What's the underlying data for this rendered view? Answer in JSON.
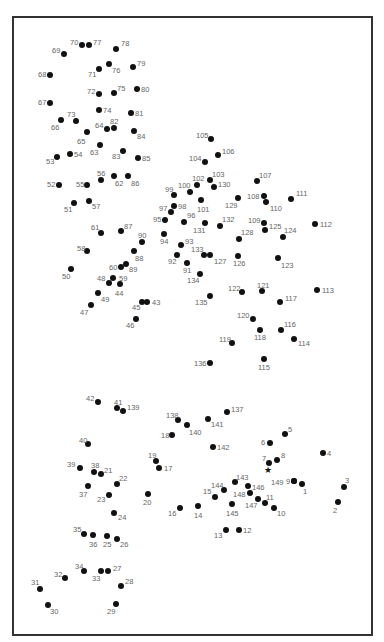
{
  "puzzle": {
    "title": "",
    "start_marker": {
      "symbol": "★",
      "x": 268,
      "y": 471
    },
    "dots": [
      {
        "n": 1,
        "x": 302,
        "y": 484,
        "lx": 303,
        "ly": 488
      },
      {
        "n": 2,
        "x": 338,
        "y": 502,
        "lx": 333,
        "ly": 507
      },
      {
        "n": 3,
        "x": 344,
        "y": 487,
        "lx": 345,
        "ly": 477
      },
      {
        "n": 4,
        "x": 323,
        "y": 453,
        "lx": 327,
        "ly": 450
      },
      {
        "n": 5,
        "x": 285,
        "y": 434,
        "lx": 288,
        "ly": 426
      },
      {
        "n": 6,
        "x": 270,
        "y": 443,
        "lx": 261,
        "ly": 439
      },
      {
        "n": 7,
        "x": 269,
        "y": 463,
        "lx": 262,
        "ly": 455
      },
      {
        "n": 8,
        "x": 277,
        "y": 460,
        "lx": 281,
        "ly": 452
      },
      {
        "n": 9,
        "x": 294,
        "y": 481,
        "lx": 286,
        "ly": 478
      },
      {
        "n": 10,
        "x": 274,
        "y": 508,
        "lx": 277,
        "ly": 510
      },
      {
        "n": 11,
        "x": 265,
        "y": 503,
        "lx": 266,
        "ly": 494
      },
      {
        "n": 12,
        "x": 239,
        "y": 530,
        "lx": 243,
        "ly": 527
      },
      {
        "n": 13,
        "x": 226,
        "y": 530,
        "lx": 214,
        "ly": 532
      },
      {
        "n": 14,
        "x": 198,
        "y": 506,
        "lx": 194,
        "ly": 512
      },
      {
        "n": 15,
        "x": 215,
        "y": 497,
        "lx": 203,
        "ly": 488
      },
      {
        "n": 16,
        "x": 180,
        "y": 508,
        "lx": 168,
        "ly": 510
      },
      {
        "n": 17,
        "x": 159,
        "y": 468,
        "lx": 164,
        "ly": 465
      },
      {
        "n": 18,
        "x": 172,
        "y": 435,
        "lx": 161,
        "ly": 432
      },
      {
        "n": 19,
        "x": 156,
        "y": 461,
        "lx": 148,
        "ly": 452
      },
      {
        "n": 20,
        "x": 148,
        "y": 494,
        "lx": 143,
        "ly": 499
      },
      {
        "n": 21,
        "x": 101,
        "y": 474,
        "lx": 104,
        "ly": 467
      },
      {
        "n": 22,
        "x": 117,
        "y": 484,
        "lx": 119,
        "ly": 475
      },
      {
        "n": 23,
        "x": 109,
        "y": 495,
        "lx": 97,
        "ly": 496
      },
      {
        "n": 24,
        "x": 114,
        "y": 513,
        "lx": 118,
        "ly": 514
      },
      {
        "n": 25,
        "x": 107,
        "y": 536,
        "lx": 103,
        "ly": 541
      },
      {
        "n": 26,
        "x": 117,
        "y": 539,
        "lx": 120,
        "ly": 541
      },
      {
        "n": 27,
        "x": 108,
        "y": 571,
        "lx": 113,
        "ly": 565
      },
      {
        "n": 28,
        "x": 121,
        "y": 586,
        "lx": 125,
        "ly": 578
      },
      {
        "n": 29,
        "x": 116,
        "y": 604,
        "lx": 107,
        "ly": 608
      },
      {
        "n": 30,
        "x": 48,
        "y": 605,
        "lx": 50,
        "ly": 608
      },
      {
        "n": 31,
        "x": 40,
        "y": 589,
        "lx": 31,
        "ly": 579
      },
      {
        "n": 32,
        "x": 65,
        "y": 578,
        "lx": 54,
        "ly": 571
      },
      {
        "n": 33,
        "x": 101,
        "y": 571,
        "lx": 92,
        "ly": 575
      },
      {
        "n": 34,
        "x": 84,
        "y": 571,
        "lx": 75,
        "ly": 563
      },
      {
        "n": 35,
        "x": 84,
        "y": 534,
        "lx": 73,
        "ly": 526
      },
      {
        "n": 36,
        "x": 93,
        "y": 535,
        "lx": 89,
        "ly": 541
      },
      {
        "n": 37,
        "x": 88,
        "y": 486,
        "lx": 79,
        "ly": 491
      },
      {
        "n": 38,
        "x": 94,
        "y": 472,
        "lx": 91,
        "ly": 462
      },
      {
        "n": 39,
        "x": 80,
        "y": 468,
        "lx": 67,
        "ly": 461
      },
      {
        "n": 40,
        "x": 88,
        "y": 444,
        "lx": 79,
        "ly": 437
      },
      {
        "n": 41,
        "x": 117,
        "y": 408,
        "lx": 114,
        "ly": 399
      },
      {
        "n": 42,
        "x": 98,
        "y": 402,
        "lx": 86,
        "ly": 395
      },
      {
        "n": 43,
        "x": 147,
        "y": 302,
        "lx": 152,
        "ly": 299
      },
      {
        "n": 44,
        "x": 120,
        "y": 284,
        "lx": 115,
        "ly": 290
      },
      {
        "n": 45,
        "x": 142,
        "y": 302,
        "lx": 132,
        "ly": 304
      },
      {
        "n": 46,
        "x": 136,
        "y": 319,
        "lx": 126,
        "ly": 322
      },
      {
        "n": 47,
        "x": 91,
        "y": 305,
        "lx": 80,
        "ly": 309
      },
      {
        "n": 48,
        "x": 109,
        "y": 283,
        "lx": 97,
        "ly": 275
      },
      {
        "n": 49,
        "x": 98,
        "y": 293,
        "lx": 101,
        "ly": 296
      },
      {
        "n": 50,
        "x": 71,
        "y": 269,
        "lx": 62,
        "ly": 273
      },
      {
        "n": 51,
        "x": 74,
        "y": 203,
        "lx": 64,
        "ly": 206
      },
      {
        "n": 52,
        "x": 59,
        "y": 185,
        "lx": 47,
        "ly": 181
      },
      {
        "n": 53,
        "x": 57,
        "y": 157,
        "lx": 46,
        "ly": 158
      },
      {
        "n": 54,
        "x": 70,
        "y": 154,
        "lx": 74,
        "ly": 151
      },
      {
        "n": 55,
        "x": 87,
        "y": 185,
        "lx": 76,
        "ly": 181
      },
      {
        "n": 56,
        "x": 101,
        "y": 180,
        "lx": 97,
        "ly": 170
      },
      {
        "n": 57,
        "x": 89,
        "y": 201,
        "lx": 92,
        "ly": 203
      },
      {
        "n": 58,
        "x": 87,
        "y": 251,
        "lx": 77,
        "ly": 245
      },
      {
        "n": 59,
        "x": 113,
        "y": 278,
        "lx": 119,
        "ly": 275
      },
      {
        "n": 60,
        "x": 121,
        "y": 267,
        "lx": 109,
        "ly": 264
      },
      {
        "n": 61,
        "x": 101,
        "y": 233,
        "lx": 91,
        "ly": 224
      },
      {
        "n": 62,
        "x": 114,
        "y": 176,
        "lx": 115,
        "ly": 180
      },
      {
        "n": 63,
        "x": 100,
        "y": 145,
        "lx": 90,
        "ly": 149
      },
      {
        "n": 64,
        "x": 107,
        "y": 129,
        "lx": 95,
        "ly": 122
      },
      {
        "n": 65,
        "x": 87,
        "y": 132,
        "lx": 77,
        "ly": 138
      },
      {
        "n": 66,
        "x": 61,
        "y": 120,
        "lx": 51,
        "ly": 124
      },
      {
        "n": 67,
        "x": 50,
        "y": 103,
        "lx": 38,
        "ly": 99
      },
      {
        "n": 68,
        "x": 50,
        "y": 75,
        "lx": 38,
        "ly": 71
      },
      {
        "n": 69,
        "x": 64,
        "y": 54,
        "lx": 52,
        "ly": 47
      },
      {
        "n": 70,
        "x": 82,
        "y": 45,
        "lx": 70,
        "ly": 39
      },
      {
        "n": 71,
        "x": 99,
        "y": 69,
        "lx": 88,
        "ly": 71
      },
      {
        "n": 72,
        "x": 99,
        "y": 94,
        "lx": 87,
        "ly": 88
      },
      {
        "n": 73,
        "x": 76,
        "y": 121,
        "lx": 67,
        "ly": 111
      },
      {
        "n": 74,
        "x": 99,
        "y": 110,
        "lx": 103,
        "ly": 107
      },
      {
        "n": 75,
        "x": 114,
        "y": 93,
        "lx": 117,
        "ly": 85
      },
      {
        "n": 76,
        "x": 109,
        "y": 64,
        "lx": 112,
        "ly": 67
      },
      {
        "n": 77,
        "x": 89,
        "y": 45,
        "lx": 93,
        "ly": 39
      },
      {
        "n": 78,
        "x": 116,
        "y": 49,
        "lx": 121,
        "ly": 40
      },
      {
        "n": 79,
        "x": 133,
        "y": 67,
        "lx": 137,
        "ly": 60
      },
      {
        "n": 80,
        "x": 137,
        "y": 89,
        "lx": 141,
        "ly": 86
      },
      {
        "n": 81,
        "x": 131,
        "y": 113,
        "lx": 135,
        "ly": 110
      },
      {
        "n": 82,
        "x": 114,
        "y": 128,
        "lx": 110,
        "ly": 118
      },
      {
        "n": 83,
        "x": 123,
        "y": 151,
        "lx": 112,
        "ly": 153
      },
      {
        "n": 84,
        "x": 134,
        "y": 131,
        "lx": 137,
        "ly": 133
      },
      {
        "n": 85,
        "x": 138,
        "y": 158,
        "lx": 142,
        "ly": 155
      },
      {
        "n": 86,
        "x": 128,
        "y": 176,
        "lx": 131,
        "ly": 180
      },
      {
        "n": 87,
        "x": 121,
        "y": 231,
        "lx": 124,
        "ly": 223
      },
      {
        "n": 88,
        "x": 134,
        "y": 251,
        "lx": 135,
        "ly": 255
      },
      {
        "n": 89,
        "x": 126,
        "y": 264,
        "lx": 129,
        "ly": 266
      },
      {
        "n": 90,
        "x": 142,
        "y": 242,
        "lx": 138,
        "ly": 232
      },
      {
        "n": 91,
        "x": 187,
        "y": 263,
        "lx": 183,
        "ly": 267
      },
      {
        "n": 92,
        "x": 177,
        "y": 255,
        "lx": 168,
        "ly": 258
      },
      {
        "n": 93,
        "x": 181,
        "y": 245,
        "lx": 185,
        "ly": 238
      },
      {
        "n": 94,
        "x": 164,
        "y": 234,
        "lx": 160,
        "ly": 238
      },
      {
        "n": 95,
        "x": 165,
        "y": 220,
        "lx": 153,
        "ly": 216
      },
      {
        "n": 96,
        "x": 184,
        "y": 222,
        "lx": 187,
        "ly": 212
      },
      {
        "n": 97,
        "x": 171,
        "y": 212,
        "lx": 159,
        "ly": 205
      },
      {
        "n": 98,
        "x": 174,
        "y": 206,
        "lx": 178,
        "ly": 203
      },
      {
        "n": 99,
        "x": 174,
        "y": 195,
        "lx": 165,
        "ly": 186
      },
      {
        "n": 100,
        "x": 190,
        "y": 192,
        "lx": 178,
        "ly": 182
      },
      {
        "n": 101,
        "x": 201,
        "y": 200,
        "lx": 197,
        "ly": 206
      },
      {
        "n": 102,
        "x": 197,
        "y": 185,
        "lx": 192,
        "ly": 175
      },
      {
        "n": 103,
        "x": 210,
        "y": 180,
        "lx": 212,
        "ly": 171
      },
      {
        "n": 104,
        "x": 205,
        "y": 162,
        "lx": 189,
        "ly": 155
      },
      {
        "n": 105,
        "x": 211,
        "y": 139,
        "lx": 196,
        "ly": 132
      },
      {
        "n": 106,
        "x": 218,
        "y": 155,
        "lx": 222,
        "ly": 148
      },
      {
        "n": 107,
        "x": 257,
        "y": 181,
        "lx": 259,
        "ly": 172
      },
      {
        "n": 108,
        "x": 264,
        "y": 196,
        "lx": 247,
        "ly": 193
      },
      {
        "n": 109,
        "x": 264,
        "y": 223,
        "lx": 248,
        "ly": 217
      },
      {
        "n": 110,
        "x": 266,
        "y": 202,
        "lx": 270,
        "ly": 205
      },
      {
        "n": 111,
        "x": 291,
        "y": 199,
        "lx": 296,
        "ly": 190
      },
      {
        "n": 112,
        "x": 315,
        "y": 224,
        "lx": 320,
        "ly": 221
      },
      {
        "n": 113,
        "x": 317,
        "y": 290,
        "lx": 322,
        "ly": 287
      },
      {
        "n": 114,
        "x": 294,
        "y": 339,
        "lx": 298,
        "ly": 340
      },
      {
        "n": 115,
        "x": 264,
        "y": 359,
        "lx": 258,
        "ly": 364
      },
      {
        "n": 116,
        "x": 281,
        "y": 330,
        "lx": 284,
        "ly": 321
      },
      {
        "n": 117,
        "x": 280,
        "y": 302,
        "lx": 285,
        "ly": 295
      },
      {
        "n": 118,
        "x": 260,
        "y": 330,
        "lx": 254,
        "ly": 334
      },
      {
        "n": 119,
        "x": 232,
        "y": 343,
        "lx": 219,
        "ly": 336
      },
      {
        "n": 120,
        "x": 253,
        "y": 319,
        "lx": 237,
        "ly": 312
      },
      {
        "n": 121,
        "x": 262,
        "y": 291,
        "lx": 257,
        "ly": 282
      },
      {
        "n": 122,
        "x": 242,
        "y": 292,
        "lx": 228,
        "ly": 285
      },
      {
        "n": 123,
        "x": 278,
        "y": 258,
        "lx": 281,
        "ly": 262
      },
      {
        "n": 124,
        "x": 283,
        "y": 237,
        "lx": 284,
        "ly": 227
      },
      {
        "n": 125,
        "x": 265,
        "y": 230,
        "lx": 269,
        "ly": 223
      },
      {
        "n": 126,
        "x": 238,
        "y": 256,
        "lx": 233,
        "ly": 260
      },
      {
        "n": 127,
        "x": 210,
        "y": 255,
        "lx": 214,
        "ly": 258
      },
      {
        "n": 128,
        "x": 239,
        "y": 239,
        "lx": 241,
        "ly": 229
      },
      {
        "n": 129,
        "x": 238,
        "y": 198,
        "lx": 225,
        "ly": 202
      },
      {
        "n": 130,
        "x": 214,
        "y": 187,
        "lx": 218,
        "ly": 181
      },
      {
        "n": 131,
        "x": 205,
        "y": 223,
        "lx": 193,
        "ly": 227
      },
      {
        "n": 132,
        "x": 220,
        "y": 226,
        "lx": 222,
        "ly": 216
      },
      {
        "n": 133,
        "x": 204,
        "y": 255,
        "lx": 191,
        "ly": 246
      },
      {
        "n": 134,
        "x": 200,
        "y": 274,
        "lx": 187,
        "ly": 277
      },
      {
        "n": 135,
        "x": 210,
        "y": 296,
        "lx": 195,
        "ly": 299
      },
      {
        "n": 136,
        "x": 210,
        "y": 363,
        "lx": 194,
        "ly": 360
      },
      {
        "n": 137,
        "x": 227,
        "y": 412,
        "lx": 231,
        "ly": 406
      },
      {
        "n": 138,
        "x": 178,
        "y": 420,
        "lx": 166,
        "ly": 412
      },
      {
        "n": 139,
        "x": 123,
        "y": 411,
        "lx": 127,
        "ly": 404
      },
      {
        "n": 140,
        "x": 187,
        "y": 425,
        "lx": 189,
        "ly": 429
      },
      {
        "n": 141,
        "x": 208,
        "y": 419,
        "lx": 211,
        "ly": 421
      },
      {
        "n": 142,
        "x": 213,
        "y": 447,
        "lx": 217,
        "ly": 444
      },
      {
        "n": 143,
        "x": 235,
        "y": 482,
        "lx": 236,
        "ly": 474
      },
      {
        "n": 144,
        "x": 224,
        "y": 490,
        "lx": 211,
        "ly": 482
      },
      {
        "n": 145,
        "x": 232,
        "y": 504,
        "lx": 226,
        "ly": 510
      },
      {
        "n": 146,
        "x": 248,
        "y": 486,
        "lx": 252,
        "ly": 484
      },
      {
        "n": 147,
        "x": 258,
        "y": 499,
        "lx": 245,
        "ly": 502
      },
      {
        "n": 148,
        "x": 250,
        "y": 493,
        "lx": 233,
        "ly": 491
      },
      {
        "n": 149,
        "x": 294,
        "y": 481,
        "lx": 271,
        "ly": 479
      }
    ]
  }
}
